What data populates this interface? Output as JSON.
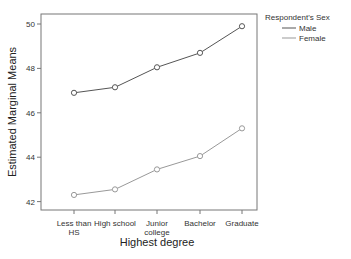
{
  "chart_data": {
    "type": "line",
    "title": "",
    "xlabel": "Highest degree",
    "ylabel": "Estimated Marginal Means",
    "categories": [
      "Less than HS",
      "High school",
      "Junior college",
      "Bachelor",
      "Graduate"
    ],
    "category_lines": [
      [
        "Less than",
        "HS"
      ],
      [
        "High school"
      ],
      [
        "Junior",
        "college"
      ],
      [
        "Bachelor"
      ],
      [
        "Graduate"
      ]
    ],
    "yticks": [
      42,
      44,
      46,
      48,
      50
    ],
    "ylim": [
      41.5,
      50.45
    ],
    "grid": false,
    "legend_position": "right-top",
    "legend_title": "Respondent's Sex",
    "series": [
      {
        "name": "Male",
        "color": "#555555",
        "values": [
          46.9,
          47.15,
          48.05,
          48.7,
          49.9
        ]
      },
      {
        "name": "Female",
        "color": "#999999",
        "values": [
          42.3,
          42.55,
          43.45,
          44.05,
          45.3
        ]
      }
    ]
  }
}
